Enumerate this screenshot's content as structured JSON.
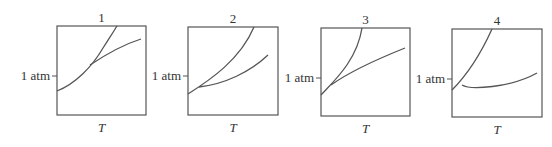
{
  "figure": {
    "panels": [
      {
        "number": "1",
        "y_label": "1 atm",
        "x_label": "T",
        "box": {
          "x": 57,
          "y": 26,
          "w": 89,
          "h": 89
        },
        "tick_y": 76,
        "curves": [
          "M57,91 C75,84 92,67 103,48 C110,37 114,31 117,26",
          "M90,65 C105,55 122,45 141,39"
        ]
      },
      {
        "number": "2",
        "y_label": "1 atm",
        "x_label": "T",
        "box": {
          "x": 188,
          "y": 27,
          "w": 90,
          "h": 88
        },
        "tick_y": 76,
        "curves": [
          "M188,94 C210,80 240,60 254,27",
          "M199,87 C225,84 250,72 268,55"
        ]
      },
      {
        "number": "3",
        "y_label": "1 atm",
        "x_label": "T",
        "box": {
          "x": 321,
          "y": 28,
          "w": 89,
          "h": 88
        },
        "tick_y": 78,
        "curves": [
          "M321,95 C335,80 357,60 362,28",
          "M331,85 C352,70 380,58 405,48"
        ]
      },
      {
        "number": "4",
        "y_label": "1 atm",
        "x_label": "T",
        "box": {
          "x": 452,
          "y": 29,
          "w": 90,
          "h": 88
        },
        "tick_y": 79,
        "curves": [
          "M452,90 C462,80 478,60 492,29",
          "M462,85 C470,90 510,88 537,73"
        ]
      }
    ]
  }
}
